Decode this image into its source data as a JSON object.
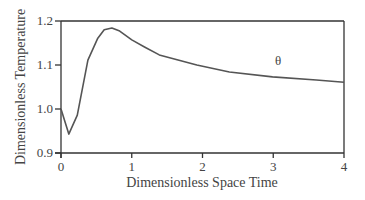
{
  "chart_data": {
    "type": "line",
    "title": "",
    "xlabel": "Dimensionless Space Time",
    "ylabel": "Dimensionless Temperature",
    "xlim": [
      0,
      4
    ],
    "ylim": [
      0.9,
      1.2
    ],
    "xticks": [
      "0",
      "1",
      "2",
      "3",
      "4"
    ],
    "yticks": [
      "0.9",
      "1.0",
      "1.1",
      "1.2"
    ],
    "grid": false,
    "legend": null,
    "annotations": [
      {
        "text": "θ",
        "x": 3.07,
        "y": 1.11
      }
    ],
    "series": [
      {
        "name": "θ",
        "color": "#555555",
        "x": [
          0,
          0.11,
          0.23,
          0.38,
          0.52,
          0.61,
          0.72,
          0.83,
          1.0,
          1.18,
          1.39,
          1.92,
          2.38,
          2.99,
          3.61,
          4.0
        ],
        "y": [
          1.0,
          0.943,
          0.986,
          1.111,
          1.161,
          1.18,
          1.184,
          1.177,
          1.157,
          1.141,
          1.123,
          1.1,
          1.084,
          1.073,
          1.066,
          1.061
        ]
      }
    ]
  }
}
